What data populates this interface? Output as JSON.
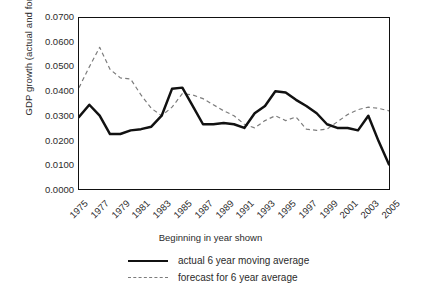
{
  "chart_data": {
    "type": "line",
    "title": "",
    "xlabel": "Beginning in year shown",
    "ylabel": "GDP growth (actual and forecast)",
    "xlim": [
      1975,
      2005
    ],
    "ylim": [
      0.0,
      0.07
    ],
    "grid": false,
    "legend_position": "below-axis",
    "y_ticks": [
      "0.0000",
      "0.0100",
      "0.0200",
      "0.0300",
      "0.0400",
      "0.0500",
      "0.0600",
      "0.0700"
    ],
    "y_tick_values": [
      0.0,
      0.01,
      0.02,
      0.03,
      0.04,
      0.05,
      0.06,
      0.07
    ],
    "x_ticks": [
      "1975",
      "1977",
      "1979",
      "1981",
      "1983",
      "1985",
      "1987",
      "1989",
      "1991",
      "1993",
      "1995",
      "1997",
      "1999",
      "2001",
      "2003",
      "2005"
    ],
    "x_tick_values": [
      1975,
      1977,
      1979,
      1981,
      1983,
      1985,
      1987,
      1989,
      1991,
      1993,
      1995,
      1997,
      1999,
      2001,
      2003,
      2005
    ],
    "x": [
      1975,
      1976,
      1977,
      1978,
      1979,
      1980,
      1981,
      1982,
      1983,
      1984,
      1985,
      1986,
      1987,
      1988,
      1989,
      1990,
      1991,
      1992,
      1993,
      1994,
      1995,
      1996,
      1997,
      1998,
      1999,
      2000,
      2001,
      2002,
      2003,
      2004,
      2005
    ],
    "series": [
      {
        "name": "actual 6 year moving average",
        "style": "solid",
        "color": "#111111",
        "values": [
          0.0295,
          0.0345,
          0.03,
          0.0225,
          0.0225,
          0.024,
          0.0245,
          0.0255,
          0.03,
          0.041,
          0.0415,
          0.034,
          0.0265,
          0.0265,
          0.027,
          0.0265,
          0.025,
          0.031,
          0.034,
          0.04,
          0.0395,
          0.0365,
          0.034,
          0.031,
          0.0265,
          0.025,
          0.025,
          0.024,
          0.03,
          0.0195,
          0.01
        ]
      },
      {
        "name": "forecast for 6 year average",
        "style": "dashed",
        "color": "#7c7c7c",
        "values": [
          0.0415,
          0.05,
          0.058,
          0.049,
          0.0455,
          0.045,
          0.0385,
          0.033,
          0.03,
          0.0335,
          0.039,
          0.0385,
          0.037,
          0.0345,
          0.032,
          0.03,
          0.0265,
          0.025,
          0.028,
          0.03,
          0.028,
          0.0295,
          0.0245,
          0.024,
          0.0245,
          0.0275,
          0.0305,
          0.0325,
          0.0335,
          0.033,
          0.032
        ]
      }
    ]
  },
  "legend": {
    "items": [
      {
        "label": "actual 6 year moving average",
        "style": "solid"
      },
      {
        "label": "forecast for 6 year average",
        "style": "dashed"
      }
    ]
  }
}
